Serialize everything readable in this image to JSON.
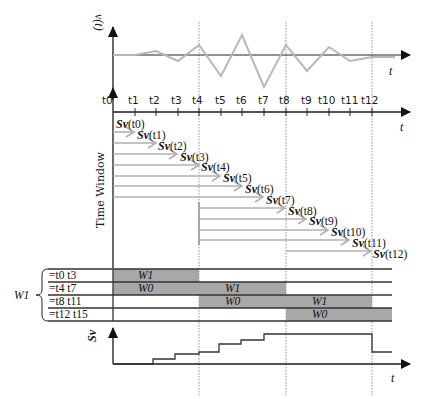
{
  "top_chart": {
    "y_label": "v(t)",
    "x_label": "t",
    "wave_color": "#b8b8b8",
    "wave_points": [
      [
        113,
        55
      ],
      [
        135,
        55
      ],
      [
        156,
        51
      ],
      [
        178,
        61
      ],
      [
        199,
        45
      ],
      [
        221,
        76
      ],
      [
        242,
        35
      ],
      [
        264,
        87
      ],
      [
        286,
        45
      ],
      [
        307,
        71
      ],
      [
        329,
        47
      ],
      [
        350,
        61
      ],
      [
        372,
        57
      ]
    ]
  },
  "time_axis": {
    "x_label": "t",
    "ticks": [
      "t0",
      "t1",
      "t2",
      "t3",
      "t4",
      "t5",
      "t6",
      "t7",
      "t8",
      "t9",
      "t10",
      "t11",
      "t12"
    ]
  },
  "time_window": {
    "label": "Time Window",
    "entries": [
      {
        "fn": "Sv",
        "arg": "(t0)"
      },
      {
        "fn": "Sv",
        "arg": "(t1)"
      },
      {
        "fn": "Sv",
        "arg": "(t2)"
      },
      {
        "fn": "Sv",
        "arg": "(t3)"
      },
      {
        "fn": "Sv",
        "arg": "(t4)"
      },
      {
        "fn": "Sv",
        "arg": "(t5)"
      },
      {
        "fn": "Sv",
        "arg": "(t6)"
      },
      {
        "fn": "Sv",
        "arg": "(t7)"
      },
      {
        "fn": "Sv",
        "arg": "(t8)"
      },
      {
        "fn": "Sv",
        "arg": "(t9)"
      },
      {
        "fn": "Sv",
        "arg": "(t10)"
      },
      {
        "fn": "Sv",
        "arg": "(t11)"
      },
      {
        "fn": "Sv",
        "arg": "(t12)"
      }
    ]
  },
  "window_table": {
    "group_label": "W1",
    "rows": [
      {
        "label": "=t0 t3"
      },
      {
        "label": "=t4 t7"
      },
      {
        "label": "=t8 t11"
      },
      {
        "label": "=t12 t15"
      }
    ],
    "blocks": [
      {
        "row": 0,
        "from": "t0",
        "to": "t4",
        "label": "W1"
      },
      {
        "row": 1,
        "from": "t0",
        "to": "t4",
        "label": "W0"
      },
      {
        "row": 1,
        "from": "t4",
        "to": "t8",
        "label": "W1"
      },
      {
        "row": 2,
        "from": "t4",
        "to": "t8",
        "label": "W0"
      },
      {
        "row": 2,
        "from": "t8",
        "to": "t12",
        "label": "W1"
      },
      {
        "row": 3,
        "from": "t8",
        "to": "t12",
        "label": "W0"
      }
    ],
    "shade_color": "#a8a8a8"
  },
  "bottom_chart": {
    "y_label": "Sv",
    "x_label": "t"
  }
}
